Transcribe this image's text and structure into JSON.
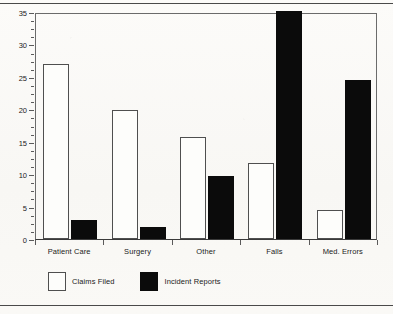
{
  "chart_data": {
    "type": "bar",
    "title": "",
    "xlabel": "",
    "ylabel": "Percent of Total",
    "ylim": [
      0,
      35
    ],
    "ytick_labels": [
      "0",
      "5",
      "10",
      "15",
      "20",
      "25",
      "30",
      "35"
    ],
    "ytick_values": [
      0,
      5,
      10,
      15,
      20,
      25,
      30,
      35
    ],
    "minor_tick_step": 1.25,
    "grid": false,
    "legend_position": "bottom-left",
    "categories": [
      "Patient Care",
      "Surgery",
      "Other",
      "Falls",
      "Med. Errors"
    ],
    "series": [
      {
        "name": "Claims Filed",
        "color": "#ffffff",
        "edge_color": "#4f4f4f",
        "values": [
          27.0,
          19.9,
          15.7,
          11.7,
          4.5
        ]
      },
      {
        "name": "Incident Reports",
        "color": "#0b0b0b",
        "edge_color": "#0b0b0b",
        "values": [
          2.9,
          1.8,
          9.7,
          35.0,
          24.5
        ],
        "notes": [
          "",
          "",
          "",
          "bar reaches top of axis (clipped at 35)",
          ""
        ]
      }
    ]
  },
  "legend": {
    "items": [
      {
        "label": "Claims Filed",
        "swatch": "white-outlined-square"
      },
      {
        "label": "Incident Reports",
        "swatch": "black-filled-square"
      }
    ]
  }
}
